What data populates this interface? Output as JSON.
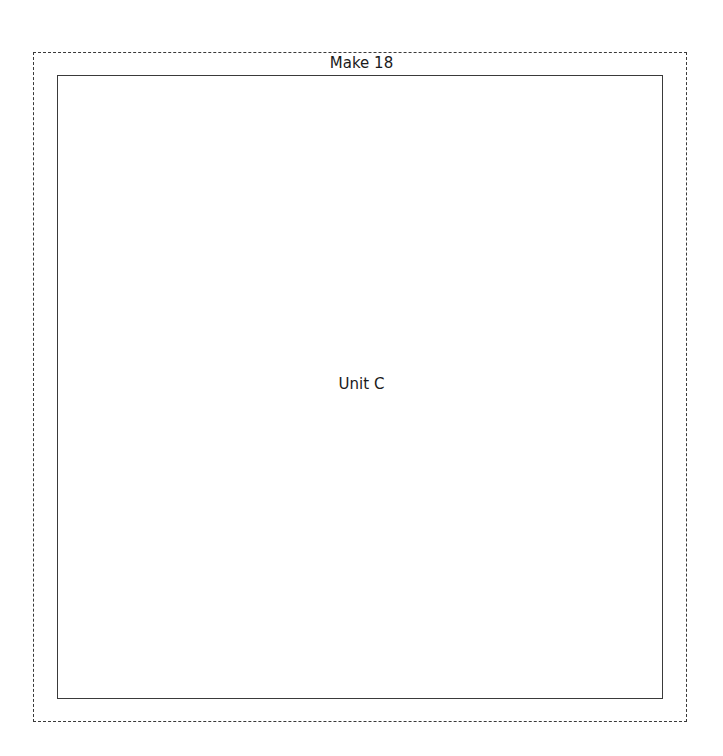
{
  "pattern": {
    "outer_frame": {
      "title": "Make 18",
      "style": "dashed"
    },
    "inner_frame": {
      "label": "Unit C",
      "style": "solid"
    }
  }
}
